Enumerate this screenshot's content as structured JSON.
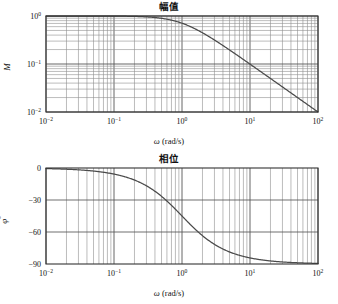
{
  "figure": {
    "width": 338,
    "height": 304,
    "background": "#ffffff",
    "line_color": "#4a4a4a",
    "grid_color_major": "#555555",
    "grid_color_minor": "#8e8e8e",
    "axis_color": "#333333"
  },
  "panels": [
    {
      "id": "magnitude",
      "title": "幅值",
      "ylabel": "M",
      "xlabel_omega": "ω",
      "xlabel_units": "(rad/s)",
      "x_ticks": [
        {
          "label_base": "10",
          "label_exp": "−2",
          "value": 0.01
        },
        {
          "label_base": "10",
          "label_exp": "−1",
          "value": 0.1
        },
        {
          "label_base": "10",
          "label_exp": "0",
          "value": 1
        },
        {
          "label_base": "10",
          "label_exp": "1",
          "value": 10
        },
        {
          "label_base": "10",
          "label_exp": "2",
          "value": 100
        }
      ],
      "y_ticks": [
        {
          "label_base": "10",
          "label_exp": "0",
          "value": 1
        },
        {
          "label_base": "10",
          "label_exp": "−1",
          "value": 0.1
        },
        {
          "label_base": "10",
          "label_exp": "−2",
          "value": 0.01
        }
      ]
    },
    {
      "id": "phase",
      "title": "相位",
      "ylabel": "φ",
      "ylabel_sup": "°",
      "xlabel_omega": "ω",
      "xlabel_units": "(rad/s)",
      "x_ticks": [
        {
          "label_base": "10",
          "label_exp": "−2",
          "value": 0.01
        },
        {
          "label_base": "10",
          "label_exp": "−1",
          "value": 0.1
        },
        {
          "label_base": "10",
          "label_exp": "0",
          "value": 1
        },
        {
          "label_base": "10",
          "label_exp": "1",
          "value": 10
        },
        {
          "label_base": "10",
          "label_exp": "2",
          "value": 100
        }
      ],
      "y_ticks": [
        {
          "label": "0",
          "value": 0
        },
        {
          "label": "−30",
          "value": -30
        },
        {
          "label": "−60",
          "value": -60
        },
        {
          "label": "−90",
          "value": -90
        }
      ]
    }
  ],
  "chart_data": [
    {
      "type": "line",
      "id": "magnitude",
      "title": "幅值",
      "xlabel": "ω (rad/s)",
      "ylabel": "M",
      "xscale": "log",
      "yscale": "log",
      "xlim": [
        0.01,
        100
      ],
      "ylim": [
        0.01,
        1
      ],
      "grid": true,
      "legend": null,
      "description": "First-order low-pass magnitude |H| = 1/sqrt(1+w^2)",
      "x": [
        0.01,
        0.0158,
        0.0251,
        0.0398,
        0.0631,
        0.1,
        0.1585,
        0.2512,
        0.3981,
        0.631,
        1.0,
        1.585,
        2.512,
        3.981,
        6.31,
        10.0,
        15.85,
        25.12,
        39.81,
        63.1,
        100.0
      ],
      "values": [
        1.0,
        0.9999,
        0.9997,
        0.9992,
        0.998,
        0.995,
        0.9876,
        0.9695,
        0.929,
        0.8457,
        0.7071,
        0.5333,
        0.3699,
        0.2433,
        0.1566,
        0.0995,
        0.063,
        0.0398,
        0.0251,
        0.0158,
        0.01
      ]
    },
    {
      "type": "line",
      "id": "phase",
      "title": "相位",
      "xlabel": "ω (rad/s)",
      "ylabel": "φ°",
      "xscale": "log",
      "yscale": "linear",
      "xlim": [
        0.01,
        100
      ],
      "ylim": [
        -90,
        0
      ],
      "grid": true,
      "legend": null,
      "description": "First-order low-pass phase = -atan(w), degrees",
      "x": [
        0.01,
        0.0158,
        0.0251,
        0.0398,
        0.0631,
        0.1,
        0.1585,
        0.2512,
        0.3981,
        0.631,
        1.0,
        1.585,
        2.512,
        3.981,
        6.31,
        10.0,
        15.85,
        25.12,
        39.81,
        63.1,
        100.0
      ],
      "values": [
        -0.57,
        -0.91,
        -1.44,
        -2.28,
        -3.61,
        -5.71,
        -9.01,
        -14.11,
        -21.71,
        -32.25,
        -45.0,
        -57.75,
        -68.29,
        -75.89,
        -80.99,
        -84.29,
        -86.39,
        -87.72,
        -88.56,
        -89.09,
        -89.43
      ]
    }
  ]
}
